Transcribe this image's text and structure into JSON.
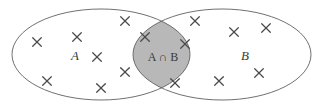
{
  "figure": {
    "kind": "venn-diagram",
    "width": 321,
    "height": 109,
    "background_color": "#ffffff"
  },
  "colors": {
    "outline": "#606060",
    "intersection_fill": "#b8b8b8",
    "label_text": "#3a3a3a",
    "element_mark": "#4a4a4a"
  },
  "sets": [
    {
      "id": "set-a",
      "label": "A",
      "label_x": 75,
      "label_y": 57,
      "ellipse": {
        "cx": 101,
        "cy": 54.5,
        "rx": 89,
        "ry": 45.5
      }
    },
    {
      "id": "set-b",
      "label": "B",
      "label_x": 245,
      "label_y": 57,
      "ellipse": {
        "cx": 222,
        "cy": 54.5,
        "rx": 89,
        "ry": 45.5
      }
    }
  ],
  "intersection": {
    "id": "intersection-ab",
    "label": "A ∩ B",
    "label_x": 163,
    "label_y": 58,
    "fill": "#b8b8b8",
    "top_crossing": {
      "x": 162,
      "y": 8
    },
    "bottom_crossing": {
      "x": 162,
      "y": 100
    }
  },
  "elements": {
    "in_a_only": [
      {
        "x": 37,
        "y": 42
      },
      {
        "x": 77,
        "y": 37
      },
      {
        "x": 97,
        "y": 57
      },
      {
        "x": 47,
        "y": 81
      },
      {
        "x": 101,
        "y": 88
      },
      {
        "x": 125,
        "y": 21
      }
    ],
    "in_intersection": [
      {
        "x": 145,
        "y": 37
      },
      {
        "x": 185,
        "y": 44
      },
      {
        "x": 125,
        "y": 72
      },
      {
        "x": 175,
        "y": 83
      }
    ],
    "in_b_only": [
      {
        "x": 195,
        "y": 21
      },
      {
        "x": 234,
        "y": 32
      },
      {
        "x": 266,
        "y": 28
      },
      {
        "x": 259,
        "y": 73
      },
      {
        "x": 219,
        "y": 81
      }
    ],
    "mark_size": 4.3
  }
}
